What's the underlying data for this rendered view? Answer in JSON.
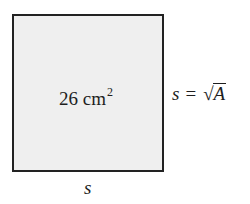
{
  "figure": {
    "square": {
      "fill_color": "#efefef",
      "border_color": "#222222"
    },
    "area_label": {
      "value": "26",
      "unit": "cm",
      "exponent": "2"
    },
    "formula": {
      "lhs": "s",
      "operator": "=",
      "radical_symbol": "√",
      "radicand": "A"
    },
    "side_label": "s"
  }
}
